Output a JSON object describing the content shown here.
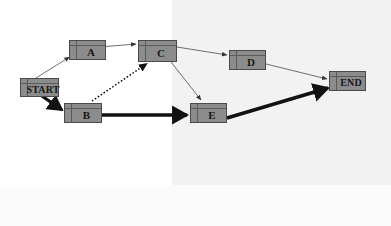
{
  "diagram": {
    "type": "flowchart",
    "title": "",
    "background_color": "#ffffff",
    "shade_color": "#f2f2f2",
    "node_fill_color": "#8c8c8c",
    "node_border_color": "#4a4a4a",
    "edge_color": "#333333",
    "nodes": [
      {
        "id": "start",
        "label": "START",
        "x": 20,
        "y": 78,
        "w": 39,
        "h": 19,
        "size": "wide"
      },
      {
        "id": "a",
        "label": "A",
        "x": 69,
        "y": 40,
        "w": 37,
        "h": 20,
        "size": "norm"
      },
      {
        "id": "c",
        "label": "C",
        "x": 138,
        "y": 40,
        "w": 39,
        "h": 22,
        "size": "norm"
      },
      {
        "id": "d",
        "label": "D",
        "x": 229,
        "y": 50,
        "w": 37,
        "h": 20,
        "size": "norm"
      },
      {
        "id": "end",
        "label": "END",
        "x": 329,
        "y": 71,
        "w": 37,
        "h": 20,
        "size": "wide"
      },
      {
        "id": "b",
        "label": "B",
        "x": 64,
        "y": 103,
        "w": 38,
        "h": 20,
        "size": "norm"
      },
      {
        "id": "e",
        "label": "E",
        "x": 190,
        "y": 103,
        "w": 37,
        "h": 20,
        "size": "norm"
      }
    ],
    "edges": [
      {
        "id": "start-a",
        "from": "start",
        "to": "a",
        "style": "thin",
        "label": ""
      },
      {
        "id": "start-b",
        "from": "start",
        "to": "b",
        "style": "thick",
        "label": ""
      },
      {
        "id": "a-c",
        "from": "a",
        "to": "c",
        "style": "thin",
        "label": ""
      },
      {
        "id": "b-c",
        "from": "b",
        "to": "c",
        "style": "dotted",
        "label": ""
      },
      {
        "id": "b-e",
        "from": "b",
        "to": "e",
        "style": "thick",
        "label": ""
      },
      {
        "id": "c-d",
        "from": "c",
        "to": "d",
        "style": "thin",
        "label": ""
      },
      {
        "id": "c-e",
        "from": "c",
        "to": "e",
        "style": "thin",
        "label": ""
      },
      {
        "id": "d-end",
        "from": "d",
        "to": "end",
        "style": "thin",
        "label": ""
      },
      {
        "id": "e-end",
        "from": "e",
        "to": "end",
        "style": "thick",
        "label": ""
      }
    ]
  }
}
